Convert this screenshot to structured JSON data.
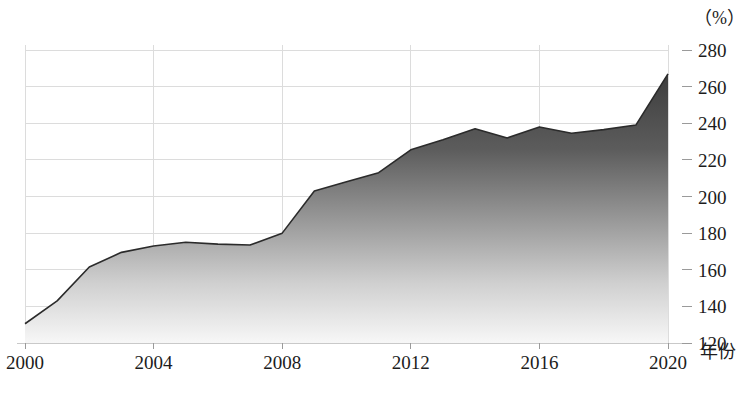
{
  "chart_data": {
    "type": "area",
    "title": "",
    "subtitle": "",
    "xlabel": "年份",
    "ylabel": "",
    "unit_label": "（%）",
    "xlim": [
      2000,
      2020
    ],
    "ylim": [
      120,
      280
    ],
    "ytick_step": 20,
    "grid": true,
    "legend": null,
    "legend_position": "none",
    "x_ticks": [
      "2000",
      "2004",
      "2008",
      "2012",
      "2016",
      "2020"
    ],
    "y_ticks": [
      "280",
      "260",
      "240",
      "220",
      "200",
      "180",
      "160",
      "140",
      "120"
    ],
    "series": [
      {
        "name": "宏观杠杆率",
        "x": [
          2000,
          2001,
          2002,
          2003,
          2004,
          2005,
          2006,
          2007,
          2008,
          2009,
          2010,
          2011,
          2012,
          2013,
          2014,
          2015,
          2016,
          2017,
          2018,
          2019,
          2020
        ],
        "values": [
          130.5,
          143.0,
          161.5,
          169.5,
          173.0,
          175.0,
          174.0,
          173.5,
          180.0,
          203.0,
          208.0,
          213.0,
          225.5,
          231.0,
          237.0,
          232.0,
          238.0,
          234.5,
          236.5,
          239.0,
          267.0
        ]
      }
    ],
    "colors": {
      "area_top": "#4a4a4a",
      "area_bottom": "#f2f2f2",
      "line": "#2b2b2b",
      "grid": "#dcdcdc",
      "axis": "#c9c9c9",
      "text": "#1c1c1c"
    }
  }
}
